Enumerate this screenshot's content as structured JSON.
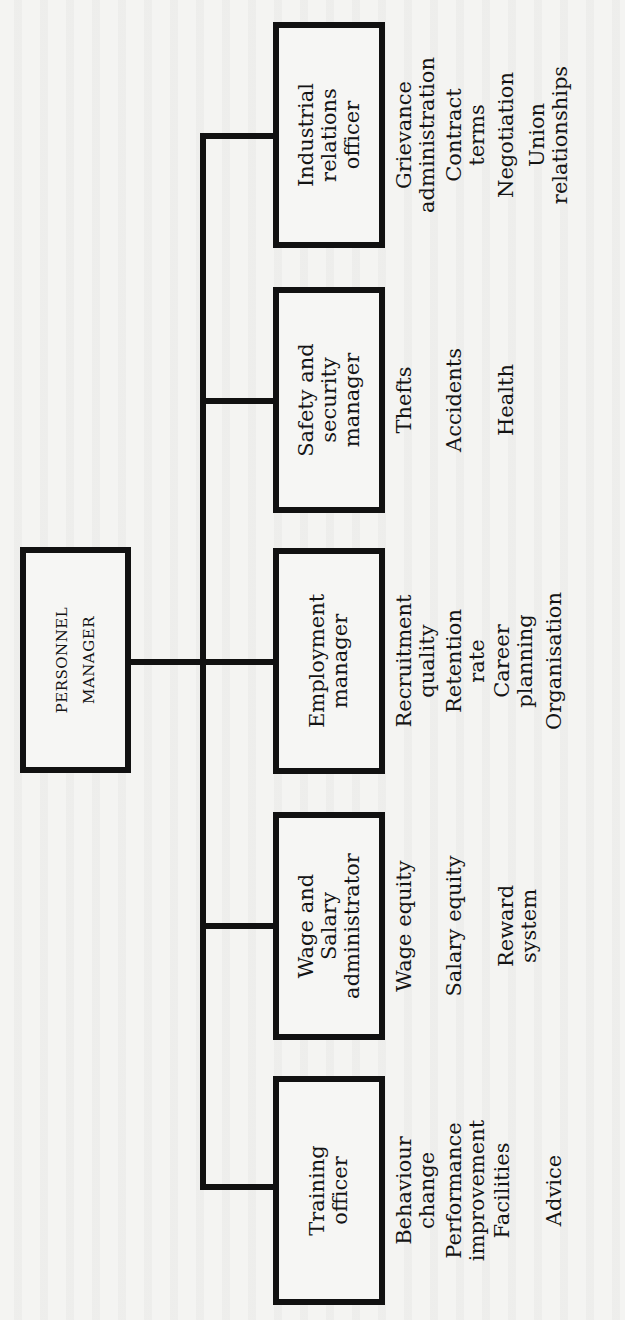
{
  "figure": {
    "type": "organisation-chart",
    "orientation": "rotated-90-ccw",
    "root": {
      "label": "PERSONNEL\nMANAGER"
    },
    "departments": [
      {
        "id": "training",
        "label": "Training\nofficer",
        "responsibilities": [
          {
            "text": "Behaviour\nchange",
            "offset": 0
          },
          {
            "text": "Performance\nimprovement",
            "offset": 50
          },
          {
            "text": "Facilities",
            "offset": 98
          },
          {
            "text": "Advice",
            "offset": 150
          }
        ]
      },
      {
        "id": "wage-salary",
        "label": "Wage and\nSalary\nadministrator",
        "responsibilities": [
          {
            "text": "Wage equity",
            "offset": 0
          },
          {
            "text": "Salary equity",
            "offset": 50
          },
          {
            "text": "Reward\nsystem",
            "offset": 102
          }
        ]
      },
      {
        "id": "employment",
        "label": "Employment\nmanager",
        "responsibilities": [
          {
            "text": "Recruitment\nquality",
            "offset": 0
          },
          {
            "text": "Retention\nrate",
            "offset": 50
          },
          {
            "text": "Career\nplanning",
            "offset": 98
          },
          {
            "text": "Organisation",
            "offset": 150
          }
        ]
      },
      {
        "id": "safety-security",
        "label": "Safety and\nsecurity\nmanager",
        "responsibilities": [
          {
            "text": "Thefts",
            "offset": 0
          },
          {
            "text": "Accidents",
            "offset": 50
          },
          {
            "text": "Health",
            "offset": 102
          }
        ]
      },
      {
        "id": "industrial-relations",
        "label": "Industrial\nrelations\nofficer",
        "responsibilities": [
          {
            "text": "Grievance\nadministration",
            "offset": 0
          },
          {
            "text": "Contract\nterms",
            "offset": 50
          },
          {
            "text": "Negotiation",
            "offset": 102
          },
          {
            "text": "Union\nrelationships",
            "offset": 133
          }
        ]
      }
    ]
  }
}
